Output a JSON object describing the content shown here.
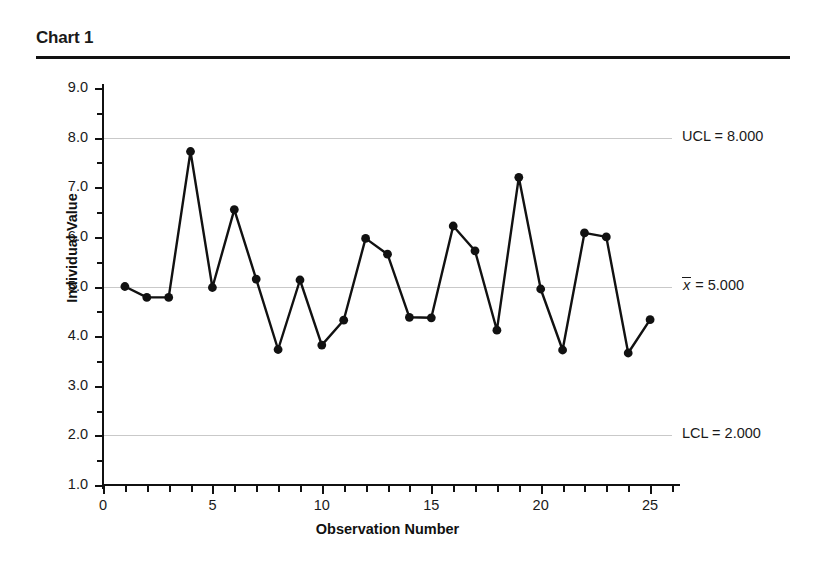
{
  "header": {
    "title": "Chart 1"
  },
  "chart_data": {
    "type": "line",
    "title": "Chart 1",
    "xlabel": "Observation Number",
    "ylabel": "Individual Value",
    "xlim": [
      0,
      26
    ],
    "ylim": [
      1.0,
      9.0
    ],
    "grid": true,
    "legend": "none",
    "x": [
      1,
      2,
      3,
      4,
      5,
      6,
      7,
      8,
      9,
      10,
      11,
      12,
      13,
      14,
      15,
      16,
      17,
      18,
      19,
      20,
      21,
      22,
      23,
      24,
      25
    ],
    "values": [
      5.0,
      4.78,
      4.78,
      7.72,
      4.98,
      6.55,
      5.15,
      3.73,
      5.13,
      3.82,
      4.32,
      5.97,
      5.65,
      4.38,
      4.37,
      6.22,
      5.72,
      4.12,
      7.2,
      4.95,
      3.72,
      6.08,
      6.0,
      3.66,
      4.33
    ],
    "x_ticks_major": [
      0,
      5,
      10,
      15,
      20,
      25
    ],
    "x_tick_labels": [
      "0",
      "5",
      "10",
      "15",
      "20",
      "25"
    ],
    "y_ticks_major": [
      1.0,
      2.0,
      3.0,
      4.0,
      5.0,
      6.0,
      7.0,
      8.0,
      9.0
    ],
    "y_tick_labels": [
      "1.0",
      "2.0",
      "3.0",
      "4.0",
      "5.0",
      "6.0",
      "7.0",
      "8.0",
      "9.0"
    ],
    "y_ticks_minor": [
      1.5,
      2.5,
      3.5,
      4.5,
      5.5,
      6.5,
      7.5,
      8.5
    ],
    "control_limits": [
      {
        "name": "UCL",
        "label": "UCL = 8.000",
        "value": 8.0
      },
      {
        "name": "center",
        "label": "= 5.000",
        "symbol": "x",
        "value": 5.0
      },
      {
        "name": "LCL",
        "label": "LCL = 2.000",
        "value": 2.0
      }
    ],
    "series_color": "#111111",
    "gridline_color": "#c9c9c9",
    "marker": "circle"
  }
}
